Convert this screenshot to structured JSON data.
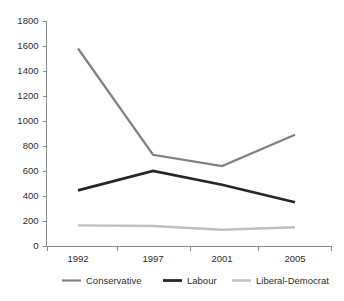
{
  "chart_data": {
    "type": "line",
    "title": "",
    "xlabel": "",
    "ylabel": "",
    "categories": [
      "1992",
      "1997",
      "2001",
      "2005"
    ],
    "ylim": [
      0,
      1800
    ],
    "ytick_step": 200,
    "yticks": [
      "0",
      "200",
      "400",
      "600",
      "800",
      "1000",
      "1200",
      "1400",
      "1600",
      "1800"
    ],
    "grid": false,
    "legend_position": "bottom",
    "series": [
      {
        "name": "Conservative",
        "color": "#808080",
        "stroke_width": 2.2,
        "values": [
          1580,
          730,
          640,
          890
        ]
      },
      {
        "name": "Labour",
        "color": "#262626",
        "stroke_width": 2.8,
        "values": [
          445,
          600,
          490,
          350
        ]
      },
      {
        "name": "Liberal-Democrat",
        "color": "#bfbfbf",
        "stroke_width": 2.4,
        "values": [
          165,
          160,
          130,
          150
        ]
      }
    ]
  },
  "legend": {
    "items": [
      {
        "label": "Conservative",
        "color": "#808080"
      },
      {
        "label": "Labour",
        "color": "#262626"
      },
      {
        "label": "Liberal-Democrat",
        "color": "#bfbfbf"
      }
    ]
  },
  "axes": {
    "y_tick_labels": [
      "1800",
      "1600",
      "1400",
      "1200",
      "1000",
      "800",
      "600",
      "400",
      "200",
      "0"
    ],
    "x_tick_labels": [
      "1992",
      "1997",
      "2001",
      "2005"
    ]
  },
  "colors": {
    "axis": "#8a8a8a",
    "text": "#2b2b2b",
    "background": "#ffffff",
    "conservative": "#808080",
    "labour": "#262626",
    "liberal_democrat": "#bfbfbf"
  }
}
